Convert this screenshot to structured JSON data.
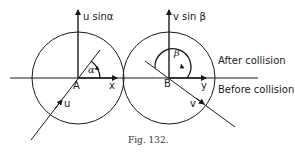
{
  "figure": {
    "caption": "Fig. 132.",
    "colors": {
      "stroke": "#1a1a1a",
      "background": "#ffffff"
    }
  },
  "labels": {
    "u_sin_alpha": "u sinα",
    "v_sin_beta": "v sin β",
    "alpha": "α",
    "beta": "β",
    "point_a": "A",
    "point_b": "B",
    "axis_x": "x",
    "axis_y": "y",
    "velocity_u": "u",
    "velocity_v": "v",
    "after_collision": "After collision",
    "before_collision": "Before collision"
  }
}
